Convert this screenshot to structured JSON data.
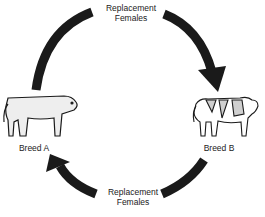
{
  "diagram": {
    "type": "crossbreeding-cycle",
    "nodes": [
      {
        "id": "breed_a",
        "label": "Breed A",
        "icon": "solid-cow-icon"
      },
      {
        "id": "breed_b",
        "label": "Breed B",
        "icon": "spotted-cow-icon"
      }
    ],
    "edges": [
      {
        "from": "breed_a",
        "to": "breed_b",
        "label_line1": "Replacement",
        "label_line2": "Females",
        "position": "top"
      },
      {
        "from": "breed_b",
        "to": "breed_a",
        "label_line1": "Replacement",
        "label_line2": "Females",
        "position": "bottom"
      }
    ],
    "colors": {
      "arrow": "#1a1a1a",
      "cow_fill": "#eeeeee",
      "text": "#222222"
    }
  }
}
